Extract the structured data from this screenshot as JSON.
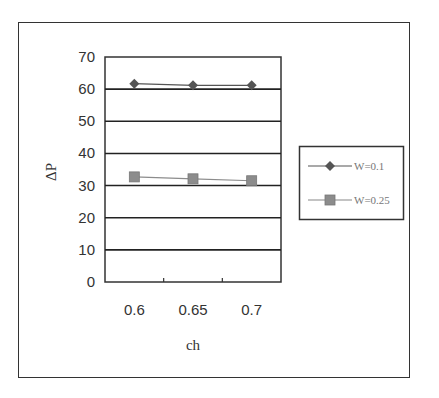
{
  "chart_data": {
    "type": "line",
    "title": "",
    "xlabel": "ch",
    "ylabel": "ΔP",
    "categories": [
      "0.6",
      "0.65",
      "0.7"
    ],
    "ylim": [
      0,
      70
    ],
    "yticks": [
      "0",
      "10",
      "20",
      "30",
      "40",
      "50",
      "60",
      "70"
    ],
    "grid": true,
    "legend_position": "right",
    "series": [
      {
        "name": "W=0.1",
        "marker": "diamond",
        "color": "#555555",
        "values": [
          61.7,
          61.2,
          61.2
        ]
      },
      {
        "name": "W=0.25",
        "marker": "square",
        "color": "#8c8c8c",
        "values": [
          32.7,
          32.1,
          31.5
        ]
      }
    ]
  },
  "legend": {
    "items": [
      {
        "label": "W=0.1"
      },
      {
        "label": "W=0.25"
      }
    ]
  }
}
